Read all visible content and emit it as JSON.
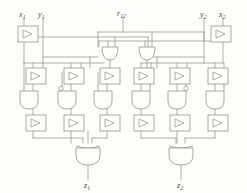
{
  "diagram": {
    "background_color": "#fdfdfc",
    "line_color": "#9a9a9a",
    "label_color": "#4a4a4a"
  },
  "inputs": [
    {
      "id": "x1",
      "base": "x",
      "sub": "1",
      "x": 22,
      "y": 14
    },
    {
      "id": "y1",
      "base": "y",
      "sub": "1",
      "x": 41,
      "y": 14
    },
    {
      "id": "r12",
      "base": "r",
      "sub": "12",
      "x": 119,
      "y": 13
    },
    {
      "id": "y2",
      "base": "y",
      "sub": "2",
      "x": 205,
      "y": 14
    },
    {
      "id": "x2",
      "base": "x",
      "sub": "2",
      "x": 224,
      "y": 14
    }
  ],
  "outputs": [
    {
      "id": "z1",
      "base": "z",
      "sub": "1",
      "x": 85,
      "y": 186
    },
    {
      "id": "z2",
      "base": "z",
      "sub": "2",
      "x": 178,
      "y": 186
    }
  ],
  "gates": {
    "inverter_boxes": [
      {
        "name": "inverter-x1",
        "x": 18,
        "y": 26
      },
      {
        "name": "inverter-x2",
        "x": 211,
        "y": 26
      },
      {
        "name": "buffer-l1",
        "x": 27,
        "y": 68
      },
      {
        "name": "buffer-l2",
        "x": 65,
        "y": 68
      },
      {
        "name": "buffer-l3",
        "x": 101,
        "y": 68
      },
      {
        "name": "buffer-r1",
        "x": 135,
        "y": 68
      },
      {
        "name": "buffer-r2",
        "x": 171,
        "y": 68
      },
      {
        "name": "buffer-r3",
        "x": 209,
        "y": 68
      },
      {
        "name": "driver-l1",
        "x": 27,
        "y": 115
      },
      {
        "name": "driver-l2",
        "x": 65,
        "y": 115
      },
      {
        "name": "driver-l3",
        "x": 101,
        "y": 115
      },
      {
        "name": "driver-r1",
        "x": 135,
        "y": 115
      },
      {
        "name": "driver-r2",
        "x": 171,
        "y": 115
      },
      {
        "name": "driver-r3",
        "x": 209,
        "y": 115
      }
    ],
    "and_gates": [
      {
        "name": "and-l1",
        "x": 27,
        "y": 91,
        "bubble": false
      },
      {
        "name": "and-l2",
        "x": 65,
        "y": 91,
        "bubble": "left"
      },
      {
        "name": "and-l3",
        "x": 101,
        "y": 91,
        "bubble": false
      },
      {
        "name": "and-r1",
        "x": 135,
        "y": 91,
        "bubble": false
      },
      {
        "name": "and-r2",
        "x": 171,
        "y": 91,
        "bubble": "right"
      },
      {
        "name": "and-r3",
        "x": 209,
        "y": 91,
        "bubble": false
      }
    ],
    "or_gates": [
      {
        "name": "or-left",
        "x": 104,
        "y": 41
      },
      {
        "name": "or-right",
        "x": 141,
        "y": 41
      }
    ],
    "xor_gates": [
      {
        "name": "xor-z1",
        "x": 85,
        "y": 143
      },
      {
        "name": "xor-z2",
        "x": 178,
        "y": 143
      }
    ]
  }
}
